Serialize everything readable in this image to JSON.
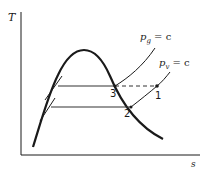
{
  "diagram": {
    "type": "T-s diagram",
    "axes": {
      "y_label": "T",
      "x_label": "s"
    },
    "curves": {
      "saturation_dome": "two-phase dome",
      "pg_label_p": "p",
      "pg_label_sub": "g",
      "pg_label_rest": " = c",
      "pv_label_p": "p",
      "pv_label_sub": "v",
      "pv_label_rest": " = c"
    },
    "points": [
      {
        "id": "1",
        "label": "1"
      },
      {
        "id": "2",
        "label": "2"
      },
      {
        "id": "3",
        "label": "3"
      }
    ],
    "colors": {
      "line": "#1a1a1a",
      "background": "#ffffff"
    }
  }
}
